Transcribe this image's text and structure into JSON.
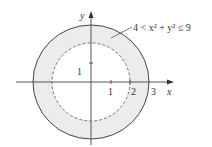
{
  "diagram": {
    "region_label": "4 < x² + y² ≤ 9",
    "axes": {
      "x_label": "x",
      "y_label": "y"
    },
    "x_ticks": [
      "1",
      "2",
      "3"
    ],
    "y_ticks": [
      "1"
    ],
    "inner_circle": {
      "radius": 2,
      "style": "dashed",
      "included": false
    },
    "outer_circle": {
      "radius": 3,
      "style": "solid",
      "included": true
    },
    "colors": {
      "region_fill": "#ececec",
      "stroke": "#444444",
      "axis": "#555555"
    }
  }
}
